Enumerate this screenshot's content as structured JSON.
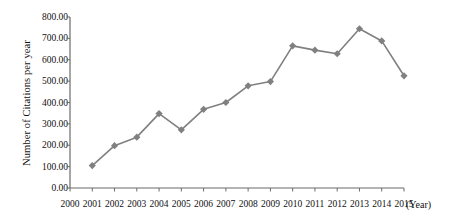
{
  "chart_data": {
    "type": "line",
    "title": "",
    "xlabel": "(Year)",
    "ylabel": "Number of Citations per year",
    "categories": [
      2000,
      2001,
      2002,
      2003,
      2004,
      2005,
      2006,
      2007,
      2008,
      2009,
      2010,
      2011,
      2012,
      2013,
      2014,
      2015
    ],
    "x_tick_labels": [
      "2000",
      "2001",
      "2002",
      "2003",
      "2004",
      "2005",
      "2006",
      "2007",
      "2008",
      "2009",
      "2010",
      "2011",
      "2012",
      "2013",
      "2014",
      "2015"
    ],
    "y_tick_labels": [
      "800.00",
      "700.00",
      "600.00",
      "500.00",
      "400.00",
      "300.00",
      "200.00",
      "100.00",
      "0.00"
    ],
    "y_tick_values": [
      800,
      700,
      600,
      500,
      400,
      300,
      200,
      100,
      0
    ],
    "ylim": [
      0,
      800
    ],
    "xlim": [
      2000,
      2015
    ],
    "grid": false,
    "legend": false,
    "series": [
      {
        "name": "Number of Citations per year",
        "color": "#808080",
        "marker": "diamond",
        "x": [
          2001,
          2002,
          2003,
          2004,
          2005,
          2006,
          2007,
          2008,
          2009,
          2010,
          2011,
          2012,
          2013,
          2014,
          2015
        ],
        "values": [
          105,
          198,
          238,
          348,
          272,
          368,
          400,
          478,
          498,
          665,
          645,
          628,
          745,
          688,
          525
        ]
      }
    ]
  },
  "axes": {
    "y_axis_title": "Number of Citations per year",
    "x_axis_title": "(Year)"
  },
  "style": {
    "line_color": "#808080",
    "marker_color": "#808080",
    "axis_color": "#6b6b6b",
    "text_color": "#111111",
    "background": "#ffffff"
  }
}
